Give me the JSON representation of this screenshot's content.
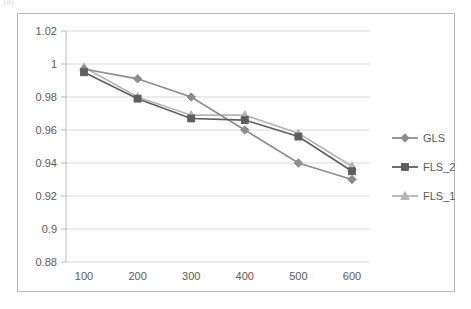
{
  "artifact": {
    "clipped_text": "(a)"
  },
  "chart_data": {
    "type": "line",
    "title": "",
    "subtitle": "",
    "xlabel": "",
    "ylabel": "",
    "x": [
      100,
      200,
      300,
      400,
      500,
      600
    ],
    "xtick_labels": [
      "100",
      "200",
      "300",
      "400",
      "500",
      "600"
    ],
    "ytick_labels": [
      "0.88",
      "0.9",
      "0.92",
      "0.94",
      "0.96",
      "0.98",
      "1",
      "1.02"
    ],
    "yticks": [
      0.88,
      0.9,
      0.92,
      0.94,
      0.96,
      0.98,
      1.0,
      1.02
    ],
    "ylim": [
      0.88,
      1.02
    ],
    "grid": "horizontal",
    "legend_position": "right",
    "series": [
      {
        "name": "GLS",
        "marker": "diamond",
        "color": "#8c8c8c",
        "values": [
          0.997,
          0.991,
          0.98,
          0.96,
          0.94,
          0.93
        ]
      },
      {
        "name": "FLS_2",
        "marker": "square",
        "color": "#5e5e5e",
        "values": [
          0.995,
          0.979,
          0.967,
          0.966,
          0.956,
          0.935
        ]
      },
      {
        "name": "FLS_1",
        "marker": "triangle",
        "color": "#b5b5b5",
        "values": [
          0.998,
          0.98,
          0.969,
          0.969,
          0.958,
          0.938
        ]
      }
    ]
  },
  "axis": {
    "line_color": "#b8b8b8",
    "grid_color": "#d9d9d9",
    "tick_color": "#b8b8b8",
    "text_color": "#595959"
  },
  "frame": {
    "border_color": "#b8b8b8",
    "background": "#ffffff"
  }
}
